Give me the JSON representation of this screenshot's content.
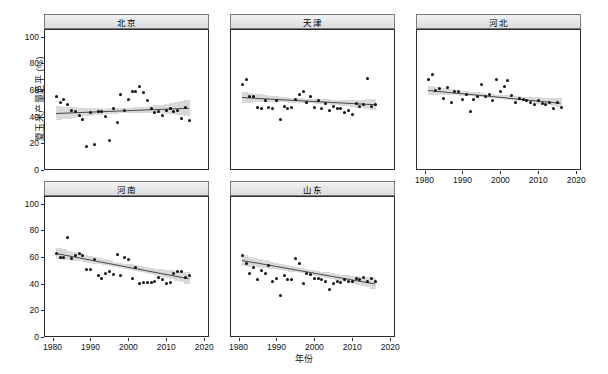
{
  "chart_data": {
    "type": "scatter",
    "title": "",
    "xlabel": "年份",
    "ylabel": "夏玉米产量距平 (%)",
    "xlim": [
      1978,
      2021
    ],
    "ylim": [
      0,
      105
    ],
    "xticks": [
      1980,
      1990,
      2000,
      2010,
      2020
    ],
    "yticks": [
      0,
      20,
      40,
      60,
      80,
      100
    ],
    "grid": false,
    "legend": "none",
    "facet_layout": {
      "rows": 2,
      "cols": 3,
      "free_axes": false
    },
    "annotations": [
      "Each panel shows a linear regression fit with shaded 95% confidence band."
    ],
    "panels": [
      {
        "name": "北京",
        "trend": {
          "x0": 1981,
          "y0": 42.5,
          "x1": 2016,
          "y1": 46.5
        },
        "band_half_width": {
          "left": 5.5,
          "middle": 1.8,
          "right": 6.0
        },
        "x": [
          1981,
          1982,
          1983,
          1984,
          1985,
          1986,
          1987,
          1988,
          1989,
          1990,
          1991,
          1992,
          1993,
          1994,
          1995,
          1996,
          1997,
          1998,
          1999,
          2000,
          2001,
          2002,
          2003,
          2004,
          2005,
          2006,
          2007,
          2008,
          2009,
          2010,
          2011,
          2012,
          2013,
          2014,
          2015,
          2016
        ],
        "y": [
          55,
          51,
          53,
          49,
          45,
          44,
          41,
          38,
          18,
          43,
          19,
          44,
          44,
          40,
          22,
          46,
          36,
          57,
          45,
          53,
          59,
          59,
          63,
          58,
          52,
          46,
          43,
          44,
          41,
          45,
          46,
          44,
          45,
          39,
          47,
          37
        ]
      },
      {
        "name": "天津",
        "trend": {
          "x0": 1981,
          "y0": 54.5,
          "x1": 2016,
          "y1": 49.0
        },
        "band_half_width": {
          "left": 4.0,
          "middle": 1.6,
          "right": 4.0
        },
        "x": [
          1981,
          1982,
          1983,
          1984,
          1985,
          1986,
          1987,
          1988,
          1989,
          1990,
          1991,
          1992,
          1993,
          1994,
          1995,
          1996,
          1997,
          1998,
          1999,
          2000,
          2001,
          2002,
          2003,
          2004,
          2005,
          2006,
          2007,
          2008,
          2009,
          2010,
          2011,
          2012,
          2013,
          2014,
          2015,
          2016
        ],
        "y": [
          64,
          68,
          55,
          55,
          47,
          46,
          52,
          47,
          46,
          52,
          38,
          48,
          46,
          47,
          53,
          57,
          59,
          51,
          55,
          47,
          52,
          46,
          50,
          45,
          48,
          46,
          46,
          43,
          45,
          42,
          50,
          48,
          49,
          69,
          48,
          49
        ]
      },
      {
        "name": "河北",
        "trend": {
          "x0": 1981,
          "y0": 60.0,
          "x1": 2016,
          "y1": 50.5
        },
        "band_half_width": {
          "left": 3.2,
          "middle": 1.3,
          "right": 3.2
        },
        "x": [
          1981,
          1982,
          1983,
          1984,
          1985,
          1986,
          1987,
          1988,
          1989,
          1990,
          1991,
          1992,
          1993,
          1994,
          1995,
          1996,
          1997,
          1998,
          1999,
          2000,
          2001,
          2002,
          2003,
          2004,
          2005,
          2006,
          2007,
          2008,
          2009,
          2010,
          2011,
          2012,
          2013,
          2014,
          2015,
          2016
        ],
        "y": [
          68,
          72,
          60,
          61,
          54,
          62,
          51,
          59,
          59,
          53,
          57,
          44,
          53,
          55,
          64,
          55,
          57,
          52,
          68,
          59,
          63,
          67,
          56,
          51,
          54,
          53,
          52,
          51,
          49,
          52,
          50,
          49,
          51,
          46,
          51,
          47
        ]
      },
      {
        "name": "河南",
        "trend": {
          "x0": 1981,
          "y0": 63.0,
          "x1": 2016,
          "y1": 44.0
        },
        "band_half_width": {
          "left": 4.2,
          "middle": 1.6,
          "right": 4.2
        },
        "x": [
          1981,
          1982,
          1983,
          1984,
          1985,
          1986,
          1987,
          1988,
          1989,
          1990,
          1991,
          1992,
          1993,
          1994,
          1995,
          1996,
          1997,
          1998,
          1999,
          2000,
          2001,
          2002,
          2003,
          2004,
          2005,
          2006,
          2007,
          2008,
          2009,
          2010,
          2011,
          2012,
          2013,
          2014,
          2015,
          2016
        ],
        "y": [
          63,
          60,
          60,
          75,
          59,
          61,
          63,
          61,
          51,
          51,
          58,
          46,
          44,
          48,
          49,
          47,
          62,
          46,
          60,
          58,
          44,
          52,
          40,
          41,
          41,
          41,
          42,
          45,
          43,
          40,
          41,
          48,
          49,
          49,
          45,
          46
        ]
      },
      {
        "name": "山东",
        "trend": {
          "x0": 1981,
          "y0": 57.5,
          "x1": 2016,
          "y1": 40.0
        },
        "band_half_width": {
          "left": 4.0,
          "middle": 1.5,
          "right": 4.0
        },
        "x": [
          1981,
          1982,
          1983,
          1984,
          1985,
          1986,
          1987,
          1988,
          1989,
          1990,
          1991,
          1992,
          1993,
          1994,
          1995,
          1996,
          1997,
          1998,
          1999,
          2000,
          2001,
          2002,
          2003,
          2004,
          2005,
          2006,
          2007,
          2008,
          2009,
          2010,
          2011,
          2012,
          2013,
          2014,
          2015,
          2016
        ],
        "y": [
          61,
          55,
          48,
          52,
          43,
          50,
          48,
          54,
          42,
          44,
          31,
          46,
          43,
          43,
          59,
          55,
          40,
          48,
          47,
          44,
          44,
          43,
          42,
          36,
          40,
          42,
          41,
          43,
          42,
          42,
          44,
          43,
          45,
          42,
          44,
          42
        ]
      }
    ]
  },
  "axes": {
    "y_tick_labels": [
      "100",
      "80",
      "60",
      "40",
      "20",
      "0"
    ],
    "x_tick_labels": [
      "1980",
      "1990",
      "2000",
      "2010",
      "2020"
    ],
    "y_title": "夏玉米产量距平 (%)",
    "x_title": "年份"
  },
  "panel_titles": {
    "p0": "北京",
    "p1": "天津",
    "p2": "河北",
    "p3": "河南",
    "p4": "山东"
  }
}
